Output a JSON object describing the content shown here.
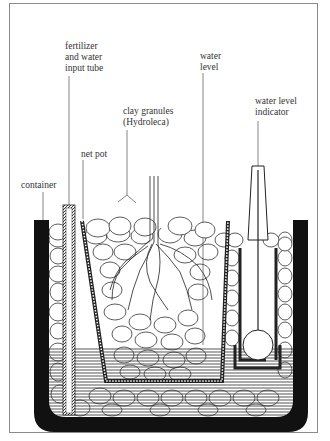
{
  "diagram": {
    "type": "cross-section illustration",
    "labels": [
      {
        "id": "fertilizer",
        "text": "fertilizer\nand water\ninput tube"
      },
      {
        "id": "water_level",
        "text": "water\nlevel"
      },
      {
        "id": "clay",
        "text": "clay granules\n(Hydroleca)"
      },
      {
        "id": "indicator",
        "text": "water level\nindicator"
      },
      {
        "id": "net_pot",
        "text": "net pot"
      },
      {
        "id": "container",
        "text": "container"
      }
    ],
    "colors": {
      "ink": "#1a1a1a",
      "frame": "#8a8a8a",
      "background": "#ffffff",
      "water_hatch": "#555555"
    }
  }
}
